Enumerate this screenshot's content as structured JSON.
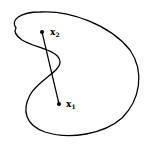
{
  "diagram": {
    "points": [
      {
        "id": "x2",
        "label": "x",
        "subscript": "2"
      },
      {
        "id": "x1",
        "label": "x",
        "subscript": "1"
      }
    ],
    "colors": {
      "stroke": "#000000",
      "background": "#ffffff"
    }
  }
}
